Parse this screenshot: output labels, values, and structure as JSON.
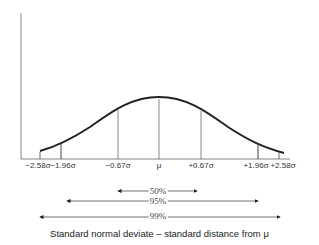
{
  "diagram": {
    "type": "normal-distribution",
    "caption": "Standard normal deviate – standard distance from μ",
    "ticks": [
      {
        "label": "−2.58σ",
        "x": 40
      },
      {
        "label": "−1.96σ",
        "x": 61
      },
      {
        "label": "−0.67σ",
        "x": 118
      },
      {
        "label": "μ",
        "x": 159
      },
      {
        "label": "+0.67σ",
        "x": 201
      },
      {
        "label": "+1.96σ",
        "x": 258
      },
      {
        "label": "+2.58σ",
        "x": 279
      }
    ],
    "intervals": [
      {
        "label": "50%",
        "from": "−0.67σ",
        "to": "+0.67σ"
      },
      {
        "label": "95%",
        "from": "−1.96σ",
        "to": "+1.96σ"
      },
      {
        "label": "99%",
        "from": "−2.58σ",
        "to": "+2.58σ"
      }
    ],
    "colors": {
      "line": "#222222",
      "thin": "#555555",
      "text": "#333333"
    }
  }
}
